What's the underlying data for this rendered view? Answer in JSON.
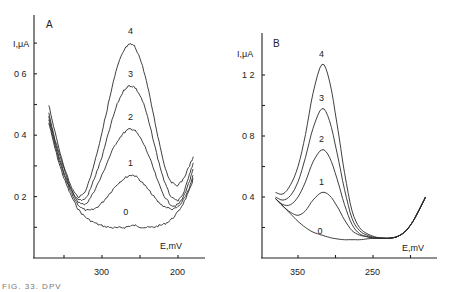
{
  "chart_data": [
    {
      "panel": "A",
      "type": "line",
      "title": "",
      "xlabel": "E,mV",
      "ylabel": "I,μA",
      "x_reversed": true,
      "xlim": [
        390,
        165
      ],
      "ylim": [
        0,
        0.78
      ],
      "x_ticks": [
        350,
        300,
        250,
        200
      ],
      "x_tick_labels": [
        "",
        "300",
        "",
        "200"
      ],
      "y_ticks": [
        0.1,
        0.2,
        0.3,
        0.4,
        0.5,
        0.6,
        0.7
      ],
      "y_tick_labels": [
        "",
        "0 2",
        "",
        "0 4",
        "",
        "0 6",
        ""
      ],
      "grid": false,
      "noisy": true,
      "series": [
        {
          "name": "0",
          "peak_E": 262,
          "peak_I": 0.105,
          "label_pos": [
            268,
            0.14
          ]
        },
        {
          "name": "1",
          "peak_E": 262,
          "peak_I": 0.27,
          "label_pos": [
            262,
            0.3
          ]
        },
        {
          "name": "2",
          "peak_E": 262,
          "peak_I": 0.42,
          "label_pos": [
            262,
            0.45
          ]
        },
        {
          "name": "3",
          "peak_E": 262,
          "peak_I": 0.56,
          "label_pos": [
            262,
            0.59
          ]
        },
        {
          "name": "4",
          "peak_E": 262,
          "peak_I": 0.695,
          "label_pos": [
            262,
            0.73
          ]
        }
      ],
      "x": [
        370,
        360,
        350,
        340,
        330,
        320,
        310,
        300,
        290,
        280,
        270,
        262,
        255,
        245,
        235,
        225,
        215,
        205,
        195,
        185,
        180
      ],
      "curves": {
        "0": [
          0.44,
          0.34,
          0.26,
          0.2,
          0.155,
          0.13,
          0.115,
          0.105,
          0.1,
          0.098,
          0.1,
          0.105,
          0.105,
          0.1,
          0.1,
          0.105,
          0.115,
          0.135,
          0.17,
          0.22,
          0.26
        ],
        "1": [
          0.45,
          0.35,
          0.27,
          0.21,
          0.17,
          0.155,
          0.16,
          0.18,
          0.21,
          0.24,
          0.26,
          0.27,
          0.265,
          0.24,
          0.21,
          0.18,
          0.165,
          0.16,
          0.18,
          0.23,
          0.27
        ],
        "2": [
          0.46,
          0.36,
          0.28,
          0.22,
          0.18,
          0.18,
          0.22,
          0.27,
          0.33,
          0.38,
          0.41,
          0.42,
          0.41,
          0.37,
          0.31,
          0.24,
          0.19,
          0.17,
          0.19,
          0.25,
          0.29
        ],
        "3": [
          0.47,
          0.37,
          0.29,
          0.22,
          0.19,
          0.2,
          0.26,
          0.33,
          0.42,
          0.5,
          0.55,
          0.56,
          0.55,
          0.5,
          0.41,
          0.31,
          0.23,
          0.19,
          0.2,
          0.27,
          0.31
        ],
        "4": [
          0.5,
          0.39,
          0.3,
          0.23,
          0.2,
          0.23,
          0.31,
          0.41,
          0.52,
          0.62,
          0.68,
          0.695,
          0.68,
          0.61,
          0.5,
          0.38,
          0.28,
          0.24,
          0.25,
          0.3,
          0.33
        ]
      }
    },
    {
      "panel": "B",
      "type": "line",
      "title": "",
      "xlabel": "E,mV",
      "ylabel": "I,μA",
      "x_reversed": true,
      "xlim": [
        395,
        170
      ],
      "ylim": [
        0,
        1.48
      ],
      "x_ticks": [
        350,
        300,
        250,
        200
      ],
      "x_tick_labels": [
        "350",
        "",
        "250",
        ""
      ],
      "y_ticks": [
        0.2,
        0.4,
        0.6,
        0.8,
        1.0,
        1.2
      ],
      "y_tick_labels": [
        "",
        "0 4",
        "",
        "0 8",
        "",
        "1 2"
      ],
      "grid": false,
      "noisy": false,
      "series": [
        {
          "name": "0",
          "peak_E": 290,
          "peak_I": 0.12,
          "label_pos": [
            320,
            0.16
          ]
        },
        {
          "name": "1",
          "peak_E": 318,
          "peak_I": 0.43,
          "label_pos": [
            318,
            0.48
          ]
        },
        {
          "name": "2",
          "peak_E": 318,
          "peak_I": 0.71,
          "label_pos": [
            318,
            0.76
          ]
        },
        {
          "name": "3",
          "peak_E": 318,
          "peak_I": 0.98,
          "label_pos": [
            318,
            1.03
          ]
        },
        {
          "name": "4",
          "peak_E": 318,
          "peak_I": 1.27,
          "label_pos": [
            318,
            1.32
          ]
        }
      ],
      "x": [
        380,
        370,
        360,
        350,
        340,
        330,
        318,
        308,
        298,
        288,
        278,
        268,
        258,
        248,
        238,
        228,
        218,
        208,
        198,
        188,
        180
      ],
      "curves": {
        "0": [
          0.39,
          0.34,
          0.29,
          0.24,
          0.2,
          0.17,
          0.15,
          0.135,
          0.125,
          0.12,
          0.12,
          0.12,
          0.125,
          0.13,
          0.13,
          0.13,
          0.14,
          0.17,
          0.23,
          0.32,
          0.4
        ],
        "1": [
          0.39,
          0.34,
          0.3,
          0.28,
          0.31,
          0.38,
          0.43,
          0.41,
          0.34,
          0.25,
          0.18,
          0.15,
          0.14,
          0.13,
          0.13,
          0.13,
          0.14,
          0.17,
          0.23,
          0.32,
          0.4
        ],
        "2": [
          0.39,
          0.35,
          0.35,
          0.4,
          0.5,
          0.63,
          0.71,
          0.66,
          0.52,
          0.35,
          0.22,
          0.16,
          0.14,
          0.13,
          0.13,
          0.13,
          0.14,
          0.17,
          0.23,
          0.32,
          0.4
        ],
        "3": [
          0.4,
          0.38,
          0.41,
          0.5,
          0.66,
          0.85,
          0.98,
          0.9,
          0.69,
          0.45,
          0.26,
          0.18,
          0.15,
          0.135,
          0.13,
          0.13,
          0.14,
          0.17,
          0.23,
          0.32,
          0.4
        ],
        "4": [
          0.43,
          0.42,
          0.48,
          0.6,
          0.81,
          1.08,
          1.27,
          1.16,
          0.88,
          0.56,
          0.31,
          0.2,
          0.16,
          0.14,
          0.13,
          0.13,
          0.14,
          0.17,
          0.23,
          0.32,
          0.4
        ]
      }
    }
  ],
  "panels": {
    "a": {
      "label": "A",
      "ylabel": "I,μA",
      "xlabel": "E,mV"
    },
    "b": {
      "label": "B",
      "ylabel": "I,μA",
      "xlabel": "E,mV"
    }
  },
  "caption": "FIG.  33.  DPV"
}
